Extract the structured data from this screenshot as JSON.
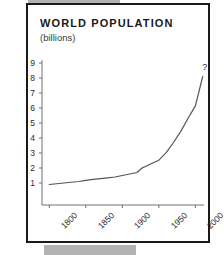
{
  "chart_data": {
    "type": "line",
    "title": "WORLD POPULATION",
    "subtitle": "(billions)",
    "ylabel": "",
    "xlabel": "",
    "xlim": [
      1790,
      2020
    ],
    "ylim": [
      0,
      9.5
    ],
    "grid": false,
    "legend": "none",
    "yticks": [
      1,
      2,
      3,
      4,
      5,
      6,
      7,
      8,
      9
    ],
    "ytick_labels": [
      "1",
      "2",
      "3",
      "4",
      "5",
      "6",
      "7",
      "8",
      "9"
    ],
    "xticks": [
      1800,
      1850,
      1900,
      1950,
      2000
    ],
    "xtick_labels": [
      "1800",
      "1850",
      "1900",
      "1950",
      "2000"
    ],
    "xtick_rotation": -45,
    "line_color": "#555555",
    "annotations": [
      {
        "text": "?",
        "x": 2012,
        "y": 8.6
      }
    ],
    "series": [
      {
        "name": "World population",
        "x": [
          1800,
          1810,
          1820,
          1830,
          1840,
          1850,
          1860,
          1870,
          1880,
          1890,
          1900,
          1910,
          1920,
          1927,
          1930,
          1940,
          1950,
          1960,
          1970,
          1980,
          1990,
          2000,
          2010
        ],
        "values": [
          0.9,
          0.95,
          1.0,
          1.05,
          1.1,
          1.18,
          1.24,
          1.29,
          1.34,
          1.4,
          1.5,
          1.6,
          1.7,
          2.0,
          2.07,
          2.3,
          2.52,
          3.02,
          3.7,
          4.44,
          5.32,
          6.14,
          8.1
        ]
      }
    ]
  }
}
